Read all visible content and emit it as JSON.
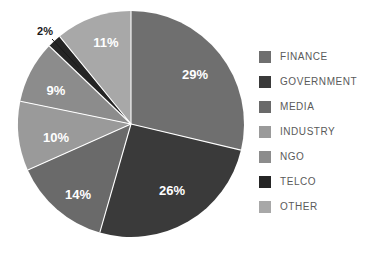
{
  "chart_data": {
    "type": "pie",
    "title": "",
    "categories": [
      "FINANCE",
      "GOVERNMENT",
      "MEDIA",
      "INDUSTRY",
      "NGO",
      "TELCO",
      "OTHER"
    ],
    "values": [
      29,
      26,
      14,
      10,
      9,
      2,
      11
    ],
    "value_labels": [
      "29%",
      "26%",
      "14%",
      "10%",
      "9%",
      "2%",
      "11%"
    ],
    "unit": "%",
    "total": 101,
    "start_angle_deg": 0,
    "direction": "clockwise",
    "legend_position": "right",
    "grid": false,
    "colors": [
      "#6f6f6f",
      "#3a3a3a",
      "#6a6a6a",
      "#9a9a9a",
      "#8c8c8c",
      "#252525",
      "#a8a8a8"
    ],
    "label_colors": [
      "#ffffff",
      "#ffffff",
      "#ffffff",
      "#ffffff",
      "#ffffff",
      "#1a1a1a",
      "#ffffff"
    ],
    "slices": [
      {
        "name": "FINANCE",
        "value": 29,
        "label": "29%",
        "color": "#6f6f6f",
        "label_inside": true,
        "label_x": 195,
        "label_y": 76
      },
      {
        "name": "GOVERNMENT",
        "value": 26,
        "label": "26%",
        "color": "#3a3a3a",
        "label_inside": true,
        "label_x": 172,
        "label_y": 192
      },
      {
        "name": "MEDIA",
        "value": 14,
        "label": "14%",
        "color": "#6a6a6a",
        "label_inside": true,
        "label_x": 78,
        "label_y": 196
      },
      {
        "name": "INDUSTRY",
        "value": 10,
        "label": "10%",
        "color": "#9a9a9a",
        "label_inside": true,
        "label_x": 56,
        "label_y": 139
      },
      {
        "name": "NGO",
        "value": 9,
        "label": "9%",
        "color": "#8c8c8c",
        "label_inside": true,
        "label_x": 56,
        "label_y": 92
      },
      {
        "name": "TELCO",
        "value": 2,
        "label": "2%",
        "color": "#252525",
        "label_inside": false,
        "label_x": 45,
        "label_y": 32
      },
      {
        "name": "OTHER",
        "value": 11,
        "label": "11%",
        "color": "#a8a8a8",
        "label_inside": true,
        "label_x": 106,
        "label_y": 44
      }
    ],
    "geometry": {
      "cx": 131,
      "cy": 124,
      "r": 113
    }
  },
  "legend": {
    "items": [
      {
        "label": "FINANCE",
        "color": "#6f6f6f"
      },
      {
        "label": "GOVERNMENT",
        "color": "#3a3a3a"
      },
      {
        "label": "MEDIA",
        "color": "#6a6a6a"
      },
      {
        "label": "INDUSTRY",
        "color": "#9a9a9a"
      },
      {
        "label": "NGO",
        "color": "#8c8c8c"
      },
      {
        "label": "TELCO",
        "color": "#252525"
      },
      {
        "label": "OTHER",
        "color": "#a8a8a8"
      }
    ]
  }
}
